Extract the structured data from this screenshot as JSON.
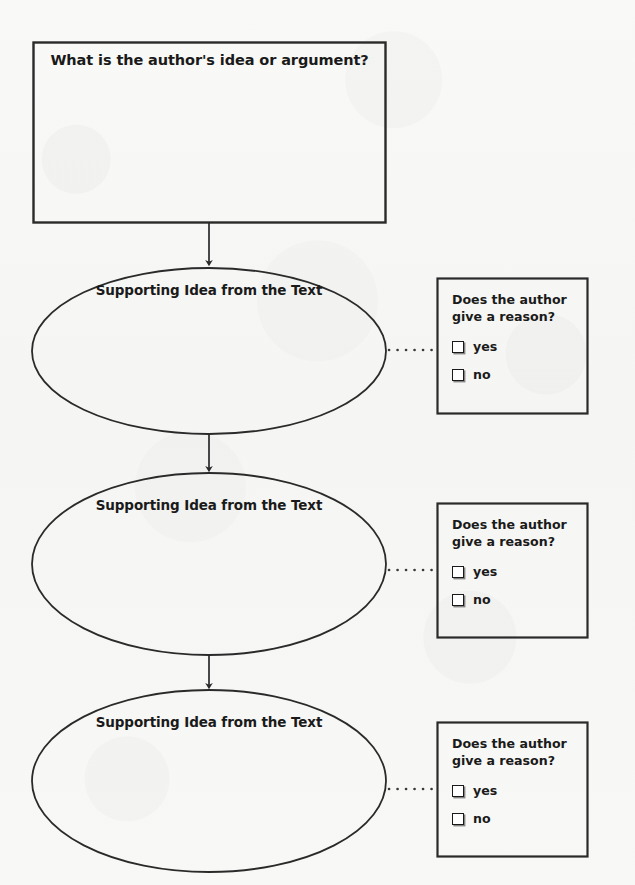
{
  "page": {
    "background_color": "#f8f8f6",
    "ink_color": "#1a1a1a"
  },
  "prompt_box": {
    "title": "What is the author's idea or argument?"
  },
  "nodes": [
    {
      "label": "Supporting Idea from the Text"
    },
    {
      "label": "Supporting Idea from the Text"
    },
    {
      "label": "Supporting Idea from the Text"
    }
  ],
  "question_boxes": [
    {
      "question": "Does the author give a reason?",
      "options": [
        {
          "label": "yes",
          "checked": false
        },
        {
          "label": "no",
          "checked": false
        }
      ]
    },
    {
      "question": "Does the author give a reason?",
      "options": [
        {
          "label": "yes",
          "checked": false
        },
        {
          "label": "no",
          "checked": false
        }
      ]
    },
    {
      "question": "Does the author give a reason?",
      "options": [
        {
          "label": "yes",
          "checked": false
        },
        {
          "label": "no",
          "checked": false
        }
      ]
    }
  ],
  "icons": {
    "checkbox": "empty-checkbox",
    "arrow": "down-arrow",
    "connector": "dotted-connector"
  }
}
